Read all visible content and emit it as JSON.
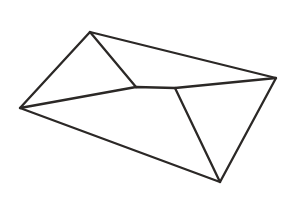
{
  "canvas": {
    "width": 290,
    "height": 203,
    "background_color": "#ffffff",
    "title": "Envelope Line Drawing"
  },
  "drawing": {
    "name": "envelope",
    "style": "black-and-white line art",
    "stroke_color": "#2b2826",
    "stroke_width": 2.3,
    "fill_color": "none",
    "vertices": {
      "left_corner": [
        20,
        108
      ],
      "top_corner": [
        90,
        32
      ],
      "right_corner": [
        276,
        78
      ],
      "bottom_corner": [
        220,
        182
      ],
      "flap_tip": [
        136,
        87
      ],
      "flap_junction": [
        175,
        88
      ]
    },
    "paths": [
      {
        "name": "envelope-body-outline",
        "d": "M 20 108 L 90 32 L 276 78 L 220 182 Z",
        "description": "outer quadrilateral of the envelope seen in perspective"
      },
      {
        "name": "flap-left-edge",
        "d": "M 90 32 L 136 87",
        "description": "left diagonal crease of the open flap running from the top corner down to the flap tip"
      },
      {
        "name": "flap-lower-edge",
        "d": "M 20 108 L 136 87 L 175 88 L 276 78",
        "description": "lower edge of the flap from the left corner through the rounded flap tip and junction to the right corner"
      },
      {
        "name": "right-panel-crease",
        "d": "M 175 88 L 220 182",
        "description": "diagonal crease from the flap junction down to the bottom corner"
      }
    ]
  }
}
